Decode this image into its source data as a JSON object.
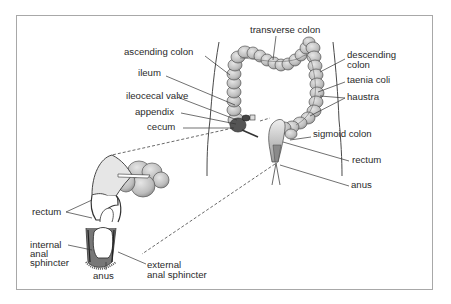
{
  "diagram": {
    "frame_border_color": "#a8a8a8",
    "ink_color": "#2a2a2a",
    "organ_fill": "#c8c8c8",
    "organ_shadow": "#9a9a9a"
  },
  "labels": {
    "transverse_colon": "transverse colon",
    "ascending_colon": "ascending colon",
    "ileum": "ileum",
    "ileocecal_valve": "ileocecal valve",
    "appendix": "appendix",
    "cecum": "cecum",
    "descending_colon_line1": "descending",
    "descending_colon_line2": "colon",
    "taenia_coli": "taenia coli",
    "haustra": "haustra",
    "sigmoid_colon": "sigmoid colon",
    "rectum_main": "rectum",
    "anus_main": "anus",
    "rectum_detail": "rectum",
    "internal_anal_sphincter_line1": "internal",
    "internal_anal_sphincter_line2": "anal",
    "internal_anal_sphincter_line3": "sphincter",
    "anus_detail": "anus",
    "external_anal_sphincter_line1": "external",
    "external_anal_sphincter_line2": "anal sphincter"
  }
}
